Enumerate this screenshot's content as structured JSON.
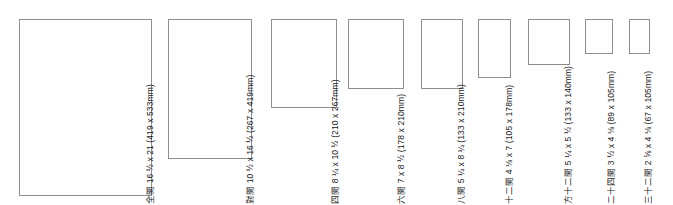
{
  "chart_data": {
    "type": "bar",
    "title": "",
    "xlabel": "",
    "ylabel": "",
    "categories": [
      "全開",
      "對開",
      "四開",
      "六開",
      "八開",
      "十二開",
      "方十二開",
      "二十四開",
      "三十二開"
    ],
    "series": [
      {
        "name": "width_mm",
        "values": [
          419,
          267,
          210,
          178,
          133,
          105,
          133,
          89,
          67
        ]
      },
      {
        "name": "height_mm",
        "values": [
          533,
          419,
          267,
          210,
          210,
          178,
          140,
          105,
          105
        ]
      }
    ],
    "legend": "none",
    "grid": false
  },
  "papers": [
    {
      "name": "全開",
      "inches": "16 ½ x 21",
      "mm": "(419 x 533mm)",
      "label": "全開 16 ½ x 21 (419 x 533mm)",
      "width_mm": 419,
      "height_mm": 533,
      "px": {
        "left": 19,
        "top": 9,
        "width": 133,
        "height": 177
      },
      "label_left": 155,
      "label_bottom": 1
    },
    {
      "name": "對開",
      "inches": "10 ½ x 16 ½",
      "mm": "(267 x 419mm)",
      "label": "對開 10 ½ x 16 ½ (267 x 419mm)",
      "width_mm": 267,
      "height_mm": 419,
      "px": {
        "left": 168,
        "top": 46,
        "width": 84,
        "height": 140
      },
      "label_left": 255,
      "label_bottom": 1
    },
    {
      "name": "四開",
      "inches": "8 ¼ x 10 ½",
      "mm": "(210 x 267mm)",
      "label": "四開 8 ¼ x 10 ½ (210 x 267mm)",
      "width_mm": 210,
      "height_mm": 267,
      "px": {
        "left": 271,
        "top": 97,
        "width": 66,
        "height": 89
      },
      "label_left": 340,
      "label_bottom": 1
    },
    {
      "name": "六開",
      "inches": "7 x 8 ½",
      "mm": "(178 x 210mm)",
      "label": "六開 7 x 8 ½ (178 x 210mm)",
      "width_mm": 178,
      "height_mm": 210,
      "px": {
        "left": 348,
        "top": 116,
        "width": 56,
        "height": 70
      },
      "label_left": 406,
      "label_bottom": 1
    },
    {
      "name": "八開",
      "inches": "5 ¼ x 8 ¼",
      "mm": "(133 x 210mm)",
      "label": "八開 5 ¼ x 8 ¼ (133 x 210mm)",
      "width_mm": 133,
      "height_mm": 210,
      "px": {
        "left": 421,
        "top": 116,
        "width": 42,
        "height": 70
      },
      "label_left": 466,
      "label_bottom": 1
    },
    {
      "name": "十二開",
      "inches": "4 ⅛ x 7",
      "mm": "(105 x 178mm)",
      "label": "十二開 4 ⅛ x 7 (105 x 178mm)",
      "width_mm": 105,
      "height_mm": 178,
      "px": {
        "left": 478,
        "top": 127,
        "width": 33,
        "height": 59
      },
      "label_left": 514,
      "label_bottom": 1
    },
    {
      "name": "方十二開",
      "inches": "5 ¼ x 5 ½",
      "mm": "(133 x 140mm)",
      "label": "方十二開 5 ¼ x 5 ½ (133 x 140mm)",
      "width_mm": 133,
      "height_mm": 140,
      "px": {
        "left": 528,
        "top": 140,
        "width": 42,
        "height": 46
      },
      "label_left": 573,
      "label_bottom": 1
    },
    {
      "name": "二十四開",
      "inches": "3 ½ x 4 ⅛",
      "mm": "(89 x 105mm)",
      "label": "二十四開 3 ½ x 4 ⅛ (89 x 105mm)",
      "width_mm": 89,
      "height_mm": 105,
      "px": {
        "left": 585,
        "top": 151,
        "width": 28,
        "height": 35
      },
      "label_left": 616,
      "label_bottom": 1
    },
    {
      "name": "三十二開",
      "inches": "2 ⅝ x 4 ⅛",
      "mm": "(67 x 105mm)",
      "label": "三十二開 2 ⅝ x 4 ⅛ (67 x 105mm)",
      "width_mm": 67,
      "height_mm": 105,
      "px": {
        "left": 629,
        "top": 151,
        "width": 21,
        "height": 35
      },
      "label_left": 653,
      "label_bottom": 1
    }
  ],
  "style": {
    "stroke_color": "#8e8e8e",
    "text_color": "#1a1a1a",
    "background": "#ffffff"
  }
}
